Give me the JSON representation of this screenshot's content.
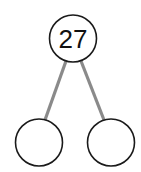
{
  "diagram": {
    "type": "number-bond",
    "colors": {
      "circle_stroke": "#1a1a1a",
      "connector": "#8a8a8a",
      "background": "#ffffff"
    },
    "nodes": [
      {
        "id": "whole",
        "label": "27",
        "cx": 73,
        "cy": 38.5,
        "r": 23.5
      },
      {
        "id": "part-left",
        "label": "",
        "cx": 39,
        "cy": 142.5,
        "r": 23.5
      },
      {
        "id": "part-right",
        "label": "",
        "cx": 111,
        "cy": 142.5,
        "r": 23.5
      }
    ],
    "edges": [
      {
        "from": "whole",
        "to": "part-left",
        "x1": 66,
        "y1": 61,
        "x2": 45,
        "y2": 120
      },
      {
        "from": "whole",
        "to": "part-right",
        "x1": 81,
        "y1": 61,
        "x2": 104,
        "y2": 120
      }
    ]
  }
}
